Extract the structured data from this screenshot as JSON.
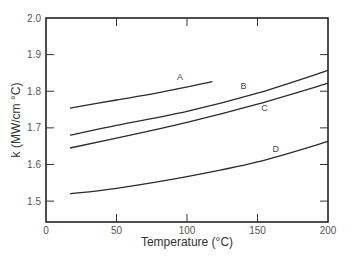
{
  "chart_data": {
    "type": "line",
    "title": "",
    "xlabel": "Temperature (°C)",
    "ylabel": "k (MW/cm °C)",
    "xlim": [
      0,
      200
    ],
    "ylim": [
      1.443,
      2.0
    ],
    "xticks": [
      0,
      50,
      100,
      150,
      200
    ],
    "xtick_labels": [
      "0",
      "50",
      "100",
      "150",
      "200"
    ],
    "yticks": [
      1.5,
      1.6,
      1.7,
      1.8,
      1.9,
      2.0
    ],
    "ytick_labels": [
      "1.5",
      "1.6",
      "1.7",
      "1.8",
      "1.9",
      "2.0"
    ],
    "grid": false,
    "legend": "inline curve labels",
    "series": [
      {
        "name": "A",
        "x": [
          17,
          50,
          80,
          118
        ],
        "values": [
          1.754,
          1.776,
          1.796,
          1.826
        ],
        "label_pos": [
          95,
          1.83
        ]
      },
      {
        "name": "B",
        "x": [
          17,
          50,
          100,
          150,
          200
        ],
        "values": [
          1.68,
          1.707,
          1.745,
          1.795,
          1.857
        ],
        "label_pos": [
          140,
          1.805
        ]
      },
      {
        "name": "C",
        "x": [
          17,
          50,
          100,
          150,
          200
        ],
        "values": [
          1.645,
          1.672,
          1.715,
          1.765,
          1.822
        ],
        "label_pos": [
          155,
          1.745
        ]
      },
      {
        "name": "D",
        "x": [
          17,
          50,
          100,
          150,
          200
        ],
        "values": [
          1.52,
          1.535,
          1.567,
          1.607,
          1.663
        ],
        "label_pos": [
          163,
          1.635
        ]
      }
    ]
  }
}
